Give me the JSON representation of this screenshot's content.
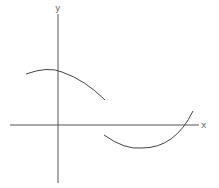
{
  "diagram": {
    "type": "function-graph",
    "axes": {
      "x_label": "x",
      "y_label": "y"
    },
    "colors": {
      "axis": "#555555",
      "curve": "#444444",
      "label": "#666666",
      "background": "#ffffff"
    },
    "pieces": [
      {
        "name": "left-branch",
        "shape": "concave-down arc, maximum near y-axis, above x-axis, ends at the discontinuity"
      },
      {
        "name": "right-branch",
        "shape": "concave-up arc, minimum below x-axis, starts at the discontinuity and crosses x-axis rising"
      }
    ]
  }
}
